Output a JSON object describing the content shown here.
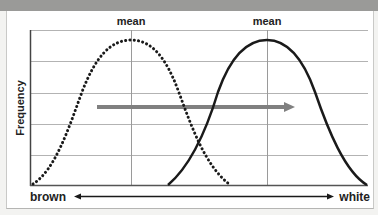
{
  "diagram": {
    "y_axis_label": "Frequency",
    "mean_labels": [
      "mean",
      "mean"
    ],
    "x_axis": {
      "left_label": "brown",
      "right_label": "white",
      "arrow": "double-headed"
    },
    "curves": [
      {
        "name": "original-distribution",
        "style": "dotted",
        "mean_position": "left"
      },
      {
        "name": "shifted-distribution",
        "style": "solid",
        "mean_position": "right"
      }
    ],
    "shift_arrow": {
      "direction": "right",
      "color": "#808080"
    },
    "colors": {
      "curve": "#1a1a1a",
      "grid": "#b0b0b0",
      "shift_arrow": "#808080",
      "top_band": "#9a9a98"
    }
  }
}
